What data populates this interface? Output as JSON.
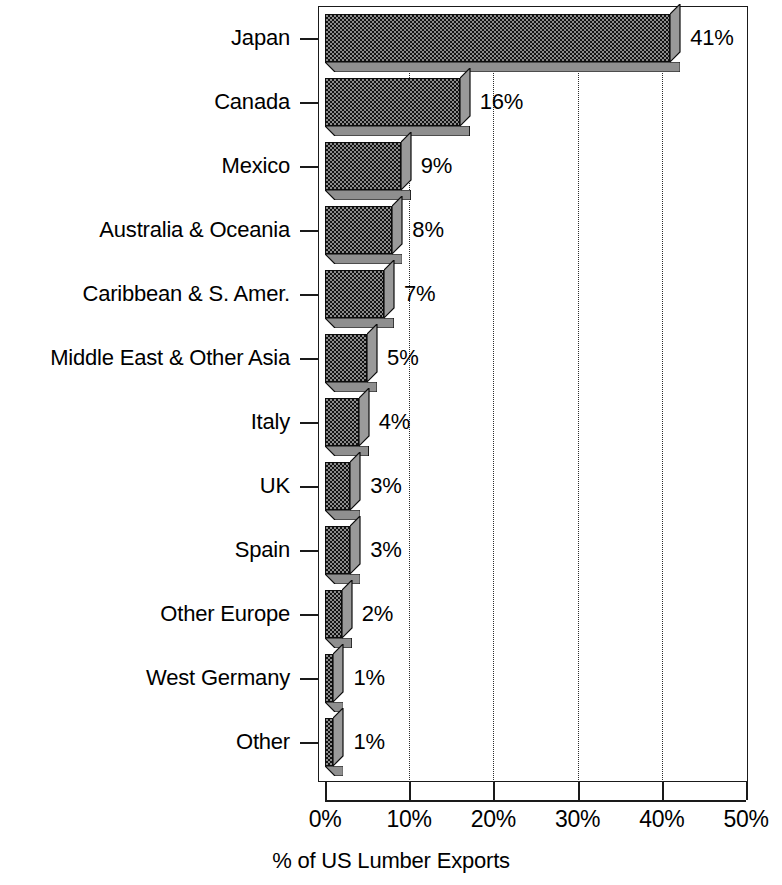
{
  "chart_data": {
    "type": "bar",
    "orientation": "horizontal",
    "title": "",
    "xlabel": "% of US Lumber Exports",
    "ylabel": "",
    "categories": [
      "Japan",
      "Canada",
      "Mexico",
      "Australia & Oceania",
      "Caribbean & S. Amer.",
      "Middle East & Other Asia",
      "Italy",
      "UK",
      "Spain",
      "Other Europe",
      "West Germany",
      "Other"
    ],
    "values": [
      41,
      16,
      9,
      8,
      7,
      5,
      4,
      3,
      3,
      2,
      1,
      1
    ],
    "data_labels": [
      "41%",
      "16%",
      "9%",
      "8%",
      "7%",
      "5%",
      "4%",
      "3%",
      "3%",
      "2%",
      "1%",
      "1%"
    ],
    "xlim": [
      0,
      50
    ],
    "xticks": [
      0,
      10,
      20,
      30,
      40,
      50
    ],
    "xtick_labels": [
      "0%",
      "10%",
      "20%",
      "30%",
      "40%",
      "50%"
    ],
    "gridlines": [
      10,
      20,
      30,
      40
    ],
    "grid": true,
    "grid_style": "dotted-vertical",
    "legend": "none",
    "style_3d": true,
    "bar_fill": "#8a8a8a",
    "bar_pattern": "checkerboard-dither",
    "bar_edge_color": "#0d0d0d",
    "axis_color": "#1a1a1a",
    "background": "#ffffff"
  },
  "axis": {
    "x_title": "% of US Lumber Exports"
  }
}
